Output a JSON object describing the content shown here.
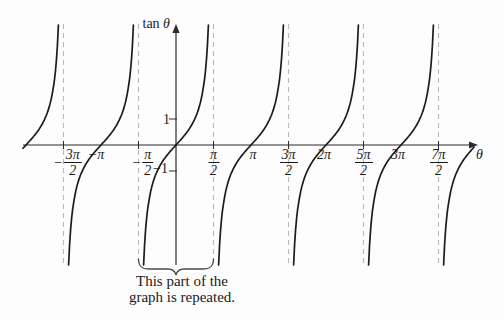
{
  "figure": {
    "y_axis_title": {
      "roman": "tan",
      "var": "θ"
    },
    "x_axis_title": "θ",
    "annotation": {
      "line1": "This part of the",
      "line2": "graph is repeated."
    }
  },
  "chart_data": {
    "type": "line",
    "function": "tan(θ)",
    "title": "",
    "xlabel": "θ",
    "ylabel": "tan θ",
    "x_unit": "radians",
    "grid": false,
    "legend": false,
    "x_range_over_pi": [
      -2.04,
      3.99
    ],
    "ylim": [
      -4.6,
      4.6
    ],
    "y_ticks": [
      {
        "value": 1,
        "label": "1"
      },
      {
        "value": -1,
        "label": "−1"
      }
    ],
    "x_ticks": [
      {
        "value_over_pi": -1.5,
        "label": "−3π/2",
        "sign": "−",
        "num": "3π",
        "den": "2",
        "label_dx_px": 4
      },
      {
        "value_over_pi": -1.0,
        "label": "−π",
        "label_dx_px": -5
      },
      {
        "value_over_pi": -0.5,
        "label": "−π/2",
        "sign": "−",
        "num": "π",
        "den": "2",
        "label_dx_px": 4
      },
      {
        "value_over_pi": 0.5,
        "label": "π/2",
        "num": "π",
        "den": "2",
        "label_dx_px": 0
      },
      {
        "value_over_pi": 1.0,
        "label": "π",
        "label_dx_px": 2
      },
      {
        "value_over_pi": 1.5,
        "label": "3π/2",
        "num": "3π",
        "den": "2",
        "label_dx_px": 0
      },
      {
        "value_over_pi": 2.0,
        "label": "2π",
        "label_dx_px": -2
      },
      {
        "value_over_pi": 2.5,
        "label": "5π/2",
        "num": "5π",
        "den": "2",
        "label_dx_px": 0
      },
      {
        "value_over_pi": 3.0,
        "label": "3π",
        "label_dx_px": -3
      },
      {
        "value_over_pi": 3.5,
        "label": "7π/2",
        "num": "7π",
        "den": "2",
        "label_dx_px": 0
      }
    ],
    "asymptotes_over_pi": [
      -1.5,
      -0.5,
      0.5,
      1.5,
      2.5,
      3.5
    ],
    "zero_crossings_over_pi": [
      -2,
      -1,
      0,
      1,
      2,
      3,
      4
    ],
    "period_brace_over_pi": [
      -0.5,
      0.5
    ],
    "layout": {
      "origin_px": [
        176,
        145
      ],
      "px_per_pi": 75,
      "px_per_unit": 26,
      "curve_top_px": 25,
      "curve_bottom_px": 265,
      "x_axis_start_px": 23,
      "x_axis_end_px": 478,
      "y_axis_top_px": 24,
      "y_axis_bottom_px": 265,
      "curve_x_max_px": 474.5
    },
    "colors": {
      "curve": "#1c1c1c",
      "axis": "#2b2b2b",
      "asymptote": "#b8b8b8",
      "brace": "#4a4a4a",
      "text": "#1a1a1a"
    }
  }
}
